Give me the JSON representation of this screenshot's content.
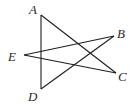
{
  "diagram": {
    "type": "geometric-figure",
    "points": {
      "A": {
        "label": "A",
        "x": 41,
        "y": 15,
        "label_x": 29,
        "label_y": 14
      },
      "B": {
        "label": "B",
        "x": 114,
        "y": 36,
        "label_x": 117,
        "label_y": 38
      },
      "C": {
        "label": "C",
        "x": 116,
        "y": 73,
        "label_x": 118,
        "label_y": 81
      },
      "D": {
        "label": "D",
        "x": 41,
        "y": 89,
        "label_x": 28,
        "label_y": 101
      },
      "E": {
        "label": "E",
        "x": 24,
        "y": 55,
        "label_x": 8,
        "label_y": 61
      }
    },
    "segments": [
      [
        "A",
        "D"
      ],
      [
        "A",
        "C"
      ],
      [
        "D",
        "B"
      ],
      [
        "E",
        "B"
      ],
      [
        "E",
        "C"
      ]
    ],
    "line_color": "#1e1e1e",
    "label_color": "#2a2a2a"
  }
}
